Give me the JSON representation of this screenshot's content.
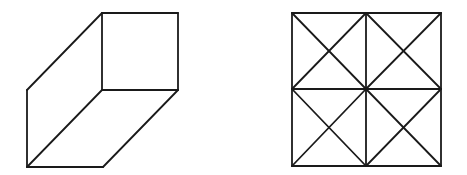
{
  "diagram": {
    "stroke_color": "#1a1a1a",
    "background": "#ffffff",
    "figures": [
      {
        "name": "oblique-prism",
        "description": "Oblique 3D box: front square face on top-right, parallelogram side faces",
        "segments": [
          [
            102,
            13,
            178,
            13
          ],
          [
            178,
            13,
            178,
            90
          ],
          [
            178,
            90,
            102,
            90
          ],
          [
            102,
            90,
            102,
            13
          ],
          [
            102,
            13,
            27,
            90
          ],
          [
            27,
            90,
            27,
            167
          ],
          [
            27,
            167,
            102,
            90
          ],
          [
            27,
            167,
            103,
            167
          ],
          [
            103,
            167,
            178,
            90
          ]
        ]
      },
      {
        "name": "subdivided-square",
        "description": "Square divided into 4 quadrants, each with both diagonals",
        "segments": [
          [
            292,
            13,
            441,
            13
          ],
          [
            441,
            13,
            441,
            166
          ],
          [
            441,
            166,
            292,
            166
          ],
          [
            292,
            166,
            292,
            13
          ],
          [
            366,
            13,
            366,
            166
          ],
          [
            292,
            89,
            441,
            89
          ],
          [
            292,
            13,
            366,
            89
          ],
          [
            366,
            13,
            292,
            89
          ],
          [
            366,
            13,
            441,
            89
          ],
          [
            441,
            13,
            366,
            89
          ],
          [
            292,
            89,
            366,
            166
          ],
          [
            366,
            89,
            292,
            166
          ],
          [
            366,
            89,
            441,
            166
          ],
          [
            441,
            89,
            366,
            166
          ]
        ]
      }
    ]
  }
}
